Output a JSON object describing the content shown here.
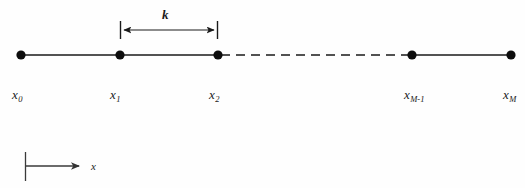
{
  "figure": {
    "type": "1d-grid-diagram",
    "background_color": "#fefefe",
    "stroke_color": "#1a1a1a",
    "axis_color": "#444444"
  },
  "dimension": {
    "label": "k",
    "from_node": "x1",
    "to_node": "x2",
    "x_start": 120,
    "x_end": 218,
    "y": 30,
    "cap_top": 21,
    "cap_bottom": 39,
    "label_x": 162,
    "label_y": 8
  },
  "grid_line": {
    "y": 55,
    "solid_segments": [
      {
        "x1": 21,
        "x2": 120
      },
      {
        "x1": 120,
        "x2": 218
      },
      {
        "x1": 412,
        "x2": 511
      }
    ],
    "dashed_segments": [
      {
        "x1": 218,
        "x2": 412,
        "dash": "9 6"
      }
    ]
  },
  "nodes": [
    {
      "id": "x0",
      "base": "x",
      "sub": "0",
      "cx": 21,
      "cy": 55,
      "r": 4.6,
      "label_x": 12,
      "label_y": 88
    },
    {
      "id": "x1",
      "base": "x",
      "sub": "1",
      "cx": 120,
      "cy": 55,
      "r": 4.6,
      "label_x": 110,
      "label_y": 88
    },
    {
      "id": "x2",
      "base": "x",
      "sub": "2",
      "cx": 218,
      "cy": 55,
      "r": 4.6,
      "label_x": 209,
      "label_y": 88
    },
    {
      "id": "xM-1",
      "base": "x",
      "sub": "M-1",
      "cx": 412,
      "cy": 55,
      "r": 4.6,
      "label_x": 404,
      "label_y": 88
    },
    {
      "id": "xM",
      "base": "x",
      "sub": "M",
      "cx": 511,
      "cy": 55,
      "r": 4.6,
      "label_x": 503,
      "label_y": 88
    }
  ],
  "axis_indicator": {
    "label": "x",
    "tick_x": 25,
    "tick_top": 152,
    "tick_bottom": 181,
    "arrow_y": 166,
    "arrow_x_start": 25,
    "arrow_x_end": 83,
    "label_x": 91,
    "label_y": 161
  }
}
